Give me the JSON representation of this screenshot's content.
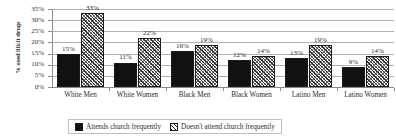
{
  "chart_data": {
    "type": "bar",
    "title": "",
    "subtitle": "",
    "xlabel": "",
    "ylabel": "% used illicit drugs",
    "ylim": [
      0,
      35
    ],
    "ytick_labels": [
      "35%",
      "30%",
      "25%",
      "20%",
      "15%",
      "10%",
      "5%",
      "0%"
    ],
    "ytick_values": [
      35,
      30,
      25,
      20,
      15,
      10,
      5,
      0
    ],
    "grid": true,
    "legend_position": "bottom",
    "categories": [
      "White Men",
      "White Women",
      "Black Men",
      "Black Women",
      "Latino Men",
      "Latino Women"
    ],
    "series": [
      {
        "name": "Attends church frequently",
        "values": [
          15,
          11,
          16,
          12,
          13,
          9
        ],
        "value_labels": [
          "15%",
          "11%",
          "16%",
          "12%",
          "13%",
          "9%"
        ],
        "fill": "solid",
        "color": "#111111"
      },
      {
        "name": "Doesn't attend church frequently",
        "values": [
          33,
          22,
          19,
          14,
          19,
          14
        ],
        "value_labels": [
          "33%",
          "22%",
          "19%",
          "14%",
          "19%",
          "14%"
        ],
        "fill": "hatched",
        "color": "#333333"
      }
    ]
  },
  "legend": {
    "entries": [
      {
        "label": "Attends church frequently"
      },
      {
        "label": "Doesn't attend church frequently"
      }
    ]
  }
}
